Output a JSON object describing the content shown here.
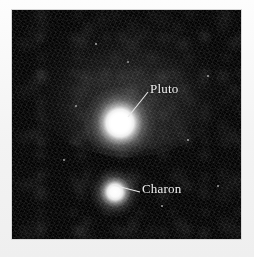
{
  "figure": {
    "kind": "astronomical-image",
    "background_color": "#030303",
    "page_color": "#f4f4f4",
    "label_color": "#f2f2f2"
  },
  "annotations": [
    {
      "id": "pluto",
      "label": "Pluto",
      "label_x": 138,
      "label_y": 72,
      "leader": {
        "x1": 136,
        "y1": 82,
        "x2": 116,
        "y2": 107
      },
      "marker": {
        "cx": 108,
        "cy": 113,
        "r": 17,
        "brightness": "bright"
      }
    },
    {
      "id": "charon",
      "label": "Charon",
      "label_x": 130,
      "label_y": 172,
      "leader": {
        "x1": 128,
        "y1": 182,
        "x2": 101,
        "y2": 175
      },
      "marker": {
        "cx": 103,
        "cy": 182,
        "r": 11,
        "brightness": "dim"
      }
    }
  ],
  "stars": [
    {
      "x": 116,
      "y": 52,
      "r": 1.1
    },
    {
      "x": 64,
      "y": 96,
      "r": 0.9
    },
    {
      "x": 176,
      "y": 130,
      "r": 0.8
    },
    {
      "x": 52,
      "y": 150,
      "r": 0.8
    },
    {
      "x": 196,
      "y": 66,
      "r": 0.7
    },
    {
      "x": 150,
      "y": 196,
      "r": 0.7
    },
    {
      "x": 84,
      "y": 34,
      "r": 0.7
    },
    {
      "x": 206,
      "y": 176,
      "r": 0.7
    }
  ]
}
